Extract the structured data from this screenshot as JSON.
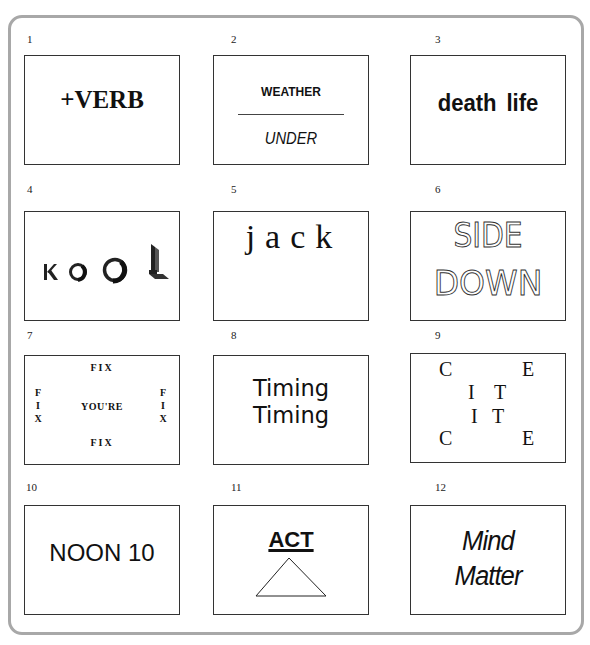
{
  "puzzles": [
    {
      "number": "1",
      "lines": [
        "+VERB"
      ]
    },
    {
      "number": "2",
      "top": "WEATHER",
      "bottom": "UNDER"
    },
    {
      "number": "3",
      "lines": [
        "death life"
      ]
    },
    {
      "number": "4",
      "lines": [
        "KOOL"
      ],
      "letters": [
        "K",
        "O",
        "O",
        "L"
      ]
    },
    {
      "number": "5",
      "lines": [
        "jack"
      ]
    },
    {
      "number": "6",
      "lines": [
        "SIDE",
        "DOWN"
      ]
    },
    {
      "number": "7",
      "top": "FIX",
      "bottom": "FIX",
      "left": [
        "F",
        "I",
        "X"
      ],
      "right": [
        "F",
        "I",
        "X"
      ],
      "center": "YOU'RE"
    },
    {
      "number": "8",
      "lines": [
        "Timing",
        "Timing"
      ]
    },
    {
      "number": "9",
      "letters": [
        "C",
        "E",
        "I",
        "T",
        "I",
        "T",
        "C",
        "E"
      ]
    },
    {
      "number": "10",
      "lines": [
        "NOON 10"
      ]
    },
    {
      "number": "11",
      "lines": [
        "ACT"
      ],
      "shape": "triangle"
    },
    {
      "number": "12",
      "lines": [
        "Mind",
        "Matter"
      ]
    }
  ]
}
